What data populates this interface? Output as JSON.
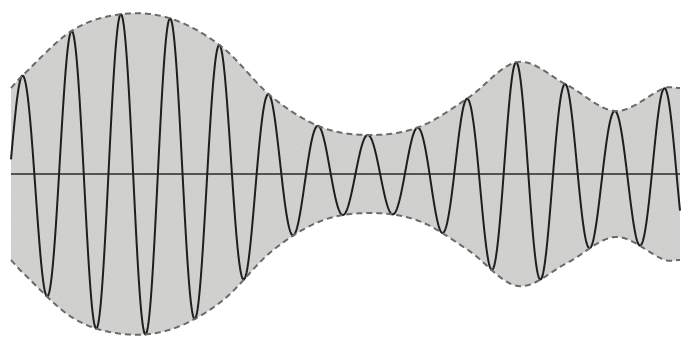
{
  "diagram": {
    "title": "Amplitude-modulated waveform",
    "colors": {
      "background": "#ffffff",
      "fill": "#d2d2d0",
      "wave": "#1e1e1e",
      "envelope": "#6a6a6a",
      "axis": "#2a2a2a"
    },
    "geometry": {
      "x_start": 11,
      "x_end": 680,
      "center_y": 174,
      "carrier_period_px": 49.4,
      "first_peak_x": 22
    },
    "envelope_points": [
      {
        "x": 11,
        "amp": 86
      },
      {
        "x": 22,
        "amp": 98
      },
      {
        "x": 73,
        "amp": 144
      },
      {
        "x": 123,
        "amp": 160
      },
      {
        "x": 172,
        "amp": 155
      },
      {
        "x": 222,
        "amp": 127
      },
      {
        "x": 272,
        "amp": 77
      },
      {
        "x": 321,
        "amp": 47
      },
      {
        "x": 370,
        "amp": 39
      },
      {
        "x": 419,
        "amp": 47
      },
      {
        "x": 468,
        "amp": 76
      },
      {
        "x": 518,
        "amp": 112
      },
      {
        "x": 567,
        "amp": 89
      },
      {
        "x": 616,
        "amp": 63
      },
      {
        "x": 665,
        "amp": 86
      },
      {
        "x": 680,
        "amp": 86
      }
    ],
    "labels": {
      "carrier": "carrier wave",
      "envelope": "modulation envelope",
      "axis": "time axis"
    }
  }
}
